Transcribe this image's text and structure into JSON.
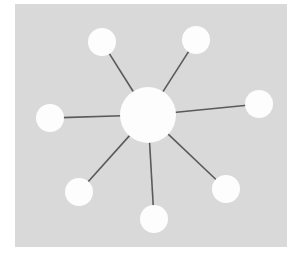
{
  "image": {
    "width": 301,
    "height": 264,
    "page_background": "#ffffff"
  },
  "panel": {
    "name": "diagram-panel",
    "x": 15,
    "y": 4,
    "width": 272,
    "height": 243,
    "fill": "#d9d9d9"
  },
  "diagram": {
    "type": "hub-and-spoke-network",
    "node_fill": "#fdfdfd",
    "node_stroke": "none",
    "edge_color": "#5a5a5a",
    "edge_width": 1.6,
    "hub": {
      "id": "hub",
      "label": "",
      "cx": 148,
      "cy": 115,
      "r": 28
    },
    "satellites": [
      {
        "id": "node-top-left",
        "label": "",
        "cx": 102,
        "cy": 42,
        "r": 14
      },
      {
        "id": "node-top-right",
        "label": "",
        "cx": 196,
        "cy": 40,
        "r": 14
      },
      {
        "id": "node-right",
        "label": "",
        "cx": 259,
        "cy": 104,
        "r": 14
      },
      {
        "id": "node-bottom-right",
        "label": "",
        "cx": 226,
        "cy": 189,
        "r": 14
      },
      {
        "id": "node-bottom",
        "label": "",
        "cx": 154,
        "cy": 219,
        "r": 14
      },
      {
        "id": "node-bottom-left",
        "label": "",
        "cx": 79,
        "cy": 192,
        "r": 14
      },
      {
        "id": "node-left",
        "label": "",
        "cx": 50,
        "cy": 118,
        "r": 14
      }
    ],
    "edges": [
      {
        "id": "edge-hub-top-left",
        "from": "hub",
        "to": "node-top-left"
      },
      {
        "id": "edge-hub-top-right",
        "from": "hub",
        "to": "node-top-right"
      },
      {
        "id": "edge-hub-right",
        "from": "hub",
        "to": "node-right"
      },
      {
        "id": "edge-hub-bottom-right",
        "from": "hub",
        "to": "node-bottom-right"
      },
      {
        "id": "edge-hub-bottom",
        "from": "hub",
        "to": "node-bottom"
      },
      {
        "id": "edge-hub-bottom-left",
        "from": "hub",
        "to": "node-bottom-left"
      },
      {
        "id": "edge-hub-left",
        "from": "hub",
        "to": "node-left"
      }
    ]
  }
}
